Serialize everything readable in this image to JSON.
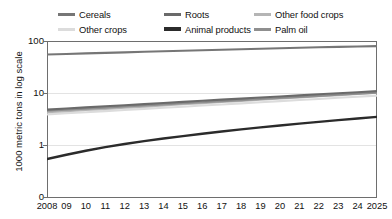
{
  "legend": {
    "items": [
      {
        "label": "Cereals",
        "color": "#767676",
        "row": 1,
        "col": 1,
        "width": 3.0
      },
      {
        "label": "Roots",
        "color": "#6a6a6a",
        "row": 1,
        "col": 2,
        "width": 3.0
      },
      {
        "label": "Other food crops",
        "color": "#b5b5b5",
        "row": 1,
        "col": 3,
        "width": 3.0
      },
      {
        "label": "Other crops",
        "color": "#dcdcdc",
        "row": 2,
        "col": 1,
        "width": 3.0
      },
      {
        "label": "Animal products",
        "color": "#2b2b2b",
        "row": 2,
        "col": 2,
        "width": 3.2
      },
      {
        "label": "Palm oil",
        "color": "#8f8f8f",
        "row": 2,
        "col": 3,
        "width": 3.0
      }
    ]
  },
  "axes": {
    "y_title": "1000 metric tons in log scale",
    "y_ticks": [
      "100",
      "10",
      "1",
      "0"
    ],
    "x_ticks": [
      "2008",
      "09",
      "10",
      "11",
      "12",
      "13",
      "14",
      "15",
      "16",
      "17",
      "18",
      "19",
      "20",
      "21",
      "22",
      "23",
      "24",
      "2025"
    ]
  },
  "chart_data": {
    "type": "line",
    "title": "",
    "xlabel": "",
    "ylabel": "1000 metric tons in log scale",
    "yscale": "log",
    "ylim": [
      0.1,
      100
    ],
    "ytick_labels": [
      "100",
      "10",
      "1",
      "0"
    ],
    "grid": true,
    "legend_position": "top",
    "x": [
      2008,
      2009,
      2010,
      2011,
      2012,
      2013,
      2014,
      2015,
      2016,
      2017,
      2018,
      2019,
      2020,
      2021,
      2022,
      2023,
      2024,
      2025
    ],
    "x_tick_labels": [
      "2008",
      "09",
      "10",
      "11",
      "12",
      "13",
      "14",
      "15",
      "16",
      "17",
      "18",
      "19",
      "20",
      "21",
      "22",
      "23",
      "24",
      "2025"
    ],
    "series": [
      {
        "name": "Cereals",
        "color": "#767676",
        "values": [
          57.5,
          58.9,
          60.3,
          61.8,
          63.3,
          64.8,
          66.3,
          67.9,
          69.5,
          71.1,
          72.7,
          74.3,
          76.0,
          77.6,
          79.2,
          80.7,
          82.1,
          83.4
        ]
      },
      {
        "name": "Roots",
        "color": "#6a6a6a",
        "values": [
          5.0,
          5.25,
          5.52,
          5.8,
          6.09,
          6.4,
          6.72,
          7.06,
          7.41,
          7.78,
          8.16,
          8.56,
          8.98,
          9.42,
          9.88,
          10.35,
          10.84,
          11.35
        ]
      },
      {
        "name": "Other food crops",
        "color": "#b5b5b5",
        "values": [
          4.45,
          4.68,
          4.92,
          5.18,
          5.45,
          5.73,
          6.03,
          6.35,
          6.68,
          7.02,
          7.39,
          7.77,
          8.18,
          8.6,
          9.05,
          9.52,
          10.02,
          10.54
        ]
      },
      {
        "name": "Other crops",
        "color": "#dcdcdc",
        "values": [
          4.05,
          4.25,
          4.46,
          4.69,
          4.92,
          5.17,
          5.43,
          5.7,
          5.99,
          6.29,
          6.61,
          6.94,
          7.29,
          7.66,
          8.04,
          8.45,
          8.87,
          9.32
        ]
      },
      {
        "name": "Palm oil",
        "color": "#8f8f8f",
        "values": [
          4.75,
          4.98,
          5.22,
          5.48,
          5.74,
          6.02,
          6.31,
          6.62,
          6.94,
          7.28,
          7.63,
          8.0,
          8.39,
          8.8,
          9.22,
          9.67,
          10.14,
          10.63
        ]
      },
      {
        "name": "Animal products",
        "color": "#2b2b2b",
        "values": [
          0.56,
          0.68,
          0.81,
          0.95,
          1.09,
          1.24,
          1.39,
          1.55,
          1.72,
          1.9,
          2.09,
          2.28,
          2.48,
          2.69,
          2.91,
          3.14,
          3.38,
          3.63
        ]
      }
    ]
  }
}
